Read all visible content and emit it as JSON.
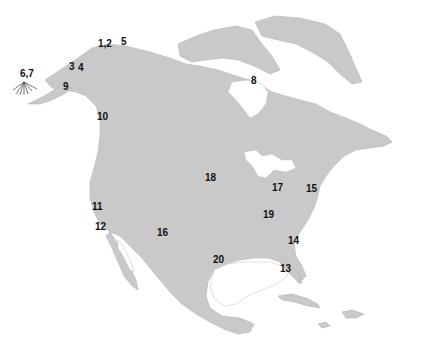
{
  "map": {
    "region": "North America",
    "land_color": "#c9c9c9",
    "water_color": "#ffffff",
    "label_color": "#111111",
    "sites": [
      {
        "id": "1,2",
        "label": "1,2",
        "area": "Northern Alaska"
      },
      {
        "id": "3",
        "label": "3",
        "area": "Western Alaska"
      },
      {
        "id": "4",
        "label": "4",
        "area": "Western Alaska"
      },
      {
        "id": "5",
        "label": "5",
        "area": "Northern Yukon"
      },
      {
        "id": "6,7",
        "label": "6,7",
        "area": "Aleutian Islands"
      },
      {
        "id": "8",
        "label": "8",
        "area": "Hudson Bay"
      },
      {
        "id": "9",
        "label": "9",
        "area": "Alaska Peninsula"
      },
      {
        "id": "10",
        "label": "10",
        "area": "British Columbia coast"
      },
      {
        "id": "11",
        "label": "11",
        "area": "Northern California"
      },
      {
        "id": "12",
        "label": "12",
        "area": "Central California"
      },
      {
        "id": "13",
        "label": "13",
        "area": "Florida"
      },
      {
        "id": "14",
        "label": "14",
        "area": "Georgia coast"
      },
      {
        "id": "15",
        "label": "15",
        "area": "New England"
      },
      {
        "id": "16",
        "label": "16",
        "area": "Southwest US"
      },
      {
        "id": "17",
        "label": "17",
        "area": "Great Lakes"
      },
      {
        "id": "18",
        "label": "18",
        "area": "Great Plains"
      },
      {
        "id": "19",
        "label": "19",
        "area": "Ohio Valley"
      },
      {
        "id": "20",
        "label": "20",
        "area": "Texas Gulf Coast"
      }
    ]
  }
}
